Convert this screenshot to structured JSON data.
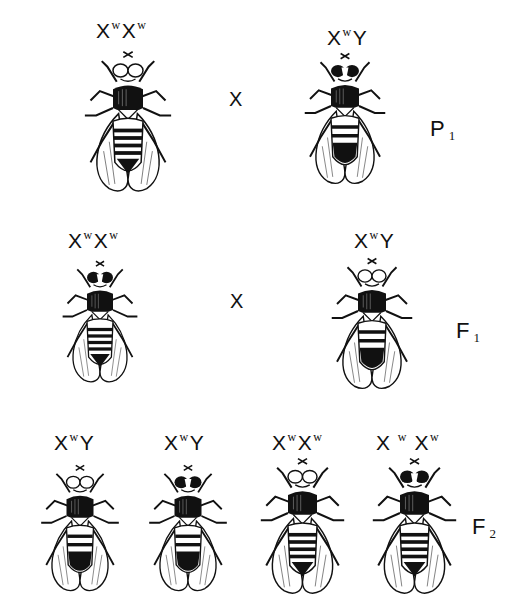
{
  "generations": [
    {
      "id": "P1",
      "label": {
        "letter": "P",
        "sub": "1"
      },
      "cross_symbol": "X",
      "flies": [
        {
          "sex": "female",
          "genotype": {
            "x1": "X",
            "s1": "w",
            "x2": "X",
            "s2": "w"
          },
          "eye": "white"
        },
        {
          "sex": "male",
          "genotype": {
            "x1": "X",
            "s1": "w",
            "x2": "Y",
            "s2": ""
          },
          "eye": "dark"
        }
      ]
    },
    {
      "id": "F1",
      "label": {
        "letter": "F",
        "sub": "1"
      },
      "cross_symbol": "X",
      "flies": [
        {
          "sex": "female",
          "genotype": {
            "x1": "X",
            "s1": "w",
            "x2": "X",
            "s2": "w"
          },
          "eye": "dark"
        },
        {
          "sex": "male",
          "genotype": {
            "x1": "X",
            "s1": "w",
            "x2": "Y",
            "s2": ""
          },
          "eye": "white"
        }
      ]
    },
    {
      "id": "F2",
      "label": {
        "letter": "F",
        "sub": "2"
      },
      "flies": [
        {
          "sex": "male",
          "genotype": {
            "x1": "X",
            "s1": "w",
            "x2": "Y",
            "s2": ""
          },
          "eye": "white"
        },
        {
          "sex": "male",
          "genotype": {
            "x1": "X",
            "s1": "w",
            "x2": "Y",
            "s2": ""
          },
          "eye": "dark"
        },
        {
          "sex": "female",
          "genotype": {
            "x1": "X",
            "s1": "w",
            "x2": "X",
            "s2": "w"
          },
          "eye": "white"
        },
        {
          "sex": "female",
          "genotype": {
            "x1": "X",
            "s1": "w",
            "x2": "X",
            "s2": "w"
          },
          "eye": "dark"
        }
      ]
    }
  ]
}
